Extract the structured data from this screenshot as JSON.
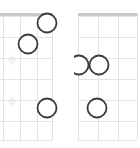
{
  "page": {
    "background_color": "#ffffff",
    "width": 140,
    "height": 148
  },
  "style": {
    "nut_color": "#c9c9c9",
    "fret_line_color": "#e3e3e3",
    "string_line_color": "#e3e3e3",
    "inlay_color": "#f2f2f2",
    "finger_dot_stroke": "#3a3a42",
    "finger_dot_fill": "#ffffff",
    "finger_dot_radius": 9.5,
    "finger_dot_stroke_width": 1.8,
    "nut_thickness": 3,
    "grid_line_width": 1
  },
  "chart_data": {
    "type": "scatter",
    "xlabel": "Strings",
    "ylabel": "Frets",
    "grid": true,
    "legend": "none",
    "diagrams": [
      {
        "name": "chord-diagram-left",
        "clipped_left_edge": true,
        "nut_visible": true,
        "nut_y": 14.5,
        "frets": 6,
        "fret_y": [
          16,
          37,
          58,
          79,
          100,
          121,
          140
        ],
        "strings_x": [
          3,
          20,
          37,
          52
        ],
        "inlays": [
          {
            "x": 12,
            "y": 60
          },
          {
            "x": 12,
            "y": 102
          }
        ],
        "dots": [
          {
            "label": "dot-1",
            "x": 47,
            "y": 23,
            "fret": 1,
            "string": 4
          },
          {
            "label": "dot-2",
            "x": 28,
            "y": 44,
            "fret": 2,
            "string": 3
          },
          {
            "label": "dot-3",
            "x": 47,
            "y": 108,
            "fret": 5,
            "string": 4
          }
        ]
      },
      {
        "name": "chord-diagram-right",
        "clipped_left_edge": false,
        "nut_visible": true,
        "nut_y": 14.5,
        "frets": 6,
        "fret_y": [
          16,
          37,
          58,
          79,
          100,
          121,
          140
        ],
        "strings_x": [
          78,
          98,
          118,
          137
        ],
        "inlays": [],
        "dots": [
          {
            "label": "dot-1",
            "x": 79,
            "y": 65,
            "fret": 3,
            "string": 1
          },
          {
            "label": "dot-2",
            "x": 99,
            "y": 65,
            "fret": 3,
            "string": 2
          },
          {
            "label": "dot-3",
            "x": 97,
            "y": 108,
            "fret": 5,
            "string": 2
          }
        ]
      }
    ]
  }
}
